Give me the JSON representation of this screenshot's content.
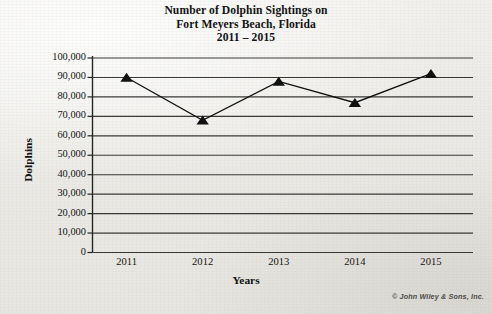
{
  "title": {
    "line1": "Number of Dolphin Sightings on",
    "line2": "Fort Meyers Beach, Florida",
    "line3": "2011 – 2015"
  },
  "credit": "© John Wiley & Sons, Inc.",
  "axis": {
    "ylabel": "Dolphins",
    "xlabel": "Years"
  },
  "chart_data": {
    "type": "line",
    "title": "Number of Dolphin Sightings on Fort Meyers Beach, Florida 2011 – 2015",
    "xlabel": "Years",
    "ylabel": "Dolphins",
    "categories": [
      "2011",
      "2012",
      "2013",
      "2014",
      "2015"
    ],
    "values": [
      90000,
      68000,
      88000,
      77000,
      92000
    ],
    "ylim": [
      0,
      100000
    ],
    "ytick_step": 10000,
    "ytick_labels": [
      "100,000",
      "90,000",
      "80,000",
      "70,000",
      "60,000",
      "50,000",
      "40,000",
      "30,000",
      "20,000",
      "10,000",
      "0"
    ],
    "ytick_values": [
      100000,
      90000,
      80000,
      70000,
      60000,
      50000,
      40000,
      30000,
      20000,
      10000,
      0
    ],
    "grid": true,
    "grid_orientation": "horizontal",
    "legend": false,
    "marker": "triangle-up",
    "marker_color": "#111111",
    "line_color": "#111111",
    "line_width": 1.3
  },
  "colors": {
    "ink": "#131313",
    "paper": "#eeedea",
    "grid": "#3a3a38"
  }
}
